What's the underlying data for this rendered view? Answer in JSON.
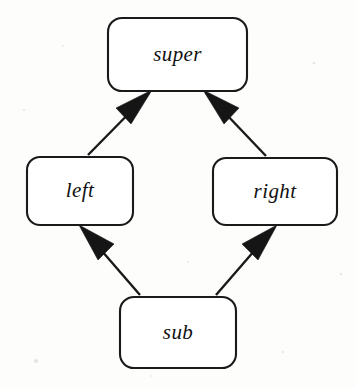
{
  "figure": {
    "kind": "inheritance-lattice-diagram",
    "width": 356,
    "height": 388,
    "background_color": "#fdfdfc",
    "stroke_color": "#1a1a1a",
    "fill_color": "#ffffff",
    "arrow_color": "#151515"
  },
  "nodes": [
    {
      "id": "super",
      "label": "super",
      "x": 108,
      "y": 18,
      "width": 139,
      "height": 73,
      "corner_radius": 14,
      "center_x": 177.5,
      "center_y": 54.5
    },
    {
      "id": "left",
      "label": "left",
      "x": 27,
      "y": 157,
      "width": 106,
      "height": 68,
      "corner_radius": 13,
      "center_x": 80,
      "center_y": 191
    },
    {
      "id": "right",
      "label": "right",
      "x": 213,
      "y": 158,
      "width": 124,
      "height": 67,
      "corner_radius": 13,
      "center_x": 275,
      "center_y": 191.5
    },
    {
      "id": "sub",
      "label": "sub",
      "x": 120,
      "y": 297,
      "width": 116,
      "height": 71,
      "corner_radius": 14,
      "center_x": 178,
      "center_y": 332.5
    }
  ],
  "edges": [
    {
      "id": "left-to-super",
      "from": "left",
      "to": "super",
      "tail_x": 88,
      "tail_y": 155,
      "head_x": 149,
      "head_y": 93,
      "head_style": "filled-triangle",
      "direction": "up-right"
    },
    {
      "id": "right-to-super",
      "from": "right",
      "to": "super",
      "tail_x": 266,
      "tail_y": 156,
      "head_x": 206,
      "head_y": 93,
      "head_style": "filled-triangle",
      "direction": "up-left"
    },
    {
      "id": "sub-to-left",
      "from": "sub",
      "to": "left",
      "tail_x": 140,
      "tail_y": 295,
      "head_x": 82,
      "head_y": 228,
      "head_style": "filled-triangle",
      "direction": "up-left"
    },
    {
      "id": "sub-to-right",
      "from": "sub",
      "to": "right",
      "tail_x": 216,
      "tail_y": 295,
      "head_x": 274,
      "head_y": 228,
      "head_style": "filled-triangle",
      "direction": "up-right"
    }
  ]
}
